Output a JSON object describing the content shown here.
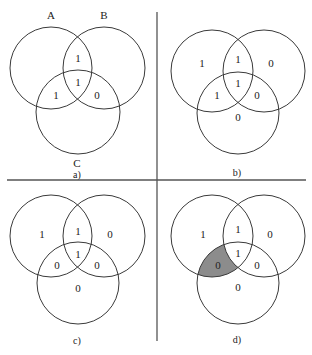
{
  "colors": {
    "stroke": "#3a3a3a",
    "shade": "#8c8c8c",
    "background": "#ffffff"
  },
  "set_labels": {
    "a": "A",
    "b": "B",
    "c": "C"
  },
  "panels": [
    {
      "id": "a",
      "caption": "a)",
      "regions": {
        "A_only": "",
        "B_only": "",
        "C_only": "",
        "AB": "1",
        "AC": "1",
        "BC": "0",
        "ABC": "1"
      },
      "shaded": []
    },
    {
      "id": "b",
      "caption": "b)",
      "regions": {
        "A_only": "1",
        "B_only": "0",
        "C_only": "0",
        "AB": "1",
        "AC": "1",
        "BC": "0",
        "ABC": "1"
      },
      "shaded": []
    },
    {
      "id": "c",
      "caption": "c)",
      "regions": {
        "A_only": "1",
        "B_only": "0",
        "C_only": "0",
        "AB": "1",
        "AC": "0",
        "BC": "0",
        "ABC": "1"
      },
      "shaded": []
    },
    {
      "id": "d",
      "caption": "d)",
      "regions": {
        "A_only": "1",
        "B_only": "0",
        "C_only": "0",
        "AB": "1",
        "AC": "0",
        "BC": "0",
        "ABC": "1"
      },
      "shaded": [
        "AC"
      ]
    }
  ]
}
